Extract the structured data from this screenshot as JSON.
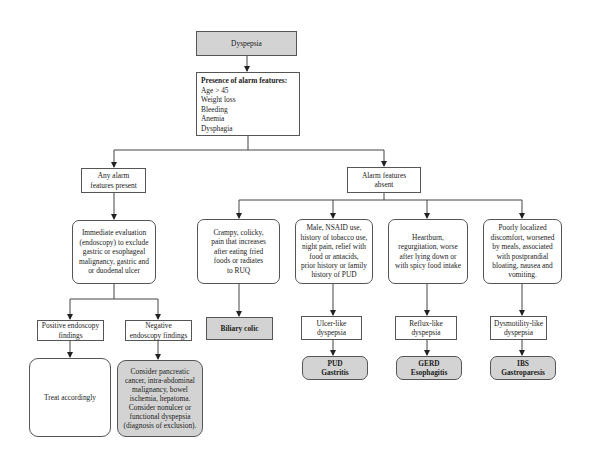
{
  "diagram": {
    "type": "flowchart",
    "nodes": {
      "root": {
        "label": "Dyspepsia",
        "fill": "#d3d3d3"
      },
      "alarm_check": {
        "title": "Presence of alarm features:",
        "items_text": "Age > 45\nWeight loss\nBleeding\nAnemia\nDysphagia",
        "items": [
          "Age > 45",
          "Weight loss",
          "Bleeding",
          "Anemia",
          "Dysphagia"
        ]
      },
      "alarm_present": {
        "label": "Any alarm\nfeatures present"
      },
      "alarm_absent": {
        "label": "Alarm features\nabsent"
      },
      "immediate_eval": {
        "label": "Immediate evaluation\n(endoscopy) to exclude\ngastric or esophageal\nmalignancy, gastric and\nor duodenal ulcer"
      },
      "positive_endo": {
        "label": "Positive endoscopy\nfindings"
      },
      "negative_endo": {
        "label": "Negative\nendoscopy findings"
      },
      "treat": {
        "label": "Treat accordingly"
      },
      "consider": {
        "label": "Consider pancreatic\ncancer, intra-abdominal\nmalignancy, bowel\nischemia, hepatoma.\nConsider nonulcer or\nfunctional dyspepsia\n(diagnosis of exclusion).",
        "fill": "#d3d3d3"
      },
      "crampy": {
        "label": "Crampy, colicky,\npain that increases\nafter eating fried\nfoods or radiates\nto RUQ"
      },
      "male_nsaid": {
        "label": "Male, NSAID use,\nhistory of tobacco use,\nnight pain, relief with\nfood or antacids,\nprior history or family\nhistory of PUD"
      },
      "heartburn": {
        "label": "Heartburn,\nregurgitation, worse\nafter lying down or\nwith spicy food intake"
      },
      "poorly_localized": {
        "label": "Poorly localized\ndiscomfort, worsened\nby meals, associated\nwith postprandial\nbloating, nausea and\nvomiting."
      },
      "biliary_colic": {
        "label": "Biliary colic",
        "fill": "#d3d3d3"
      },
      "ulcer_like": {
        "label": "Ulcer-like\ndyspepsia"
      },
      "reflux_like": {
        "label": "Reflux-like\ndyspepsia"
      },
      "dysmotility_like": {
        "label": "Dysmotility-like\ndyspepsia"
      },
      "pud": {
        "label": "PUD\nGastritis",
        "fill": "#d3d3d3"
      },
      "gerd": {
        "label": "GERD\nEsophagitis",
        "fill": "#d3d3d3"
      },
      "ibs": {
        "label": "IBS\nGastroparesis",
        "fill": "#d3d3d3"
      }
    },
    "edges": [
      [
        "root",
        "alarm_check"
      ],
      [
        "alarm_check",
        "alarm_present"
      ],
      [
        "alarm_check",
        "alarm_absent"
      ],
      [
        "alarm_present",
        "immediate_eval"
      ],
      [
        "immediate_eval",
        "positive_endo"
      ],
      [
        "immediate_eval",
        "negative_endo"
      ],
      [
        "positive_endo",
        "treat"
      ],
      [
        "negative_endo",
        "consider"
      ],
      [
        "alarm_absent",
        "crampy"
      ],
      [
        "alarm_absent",
        "male_nsaid"
      ],
      [
        "alarm_absent",
        "heartburn"
      ],
      [
        "alarm_absent",
        "poorly_localized"
      ],
      [
        "crampy",
        "biliary_colic"
      ],
      [
        "male_nsaid",
        "ulcer_like"
      ],
      [
        "heartburn",
        "reflux_like"
      ],
      [
        "poorly_localized",
        "dysmotility_like"
      ],
      [
        "ulcer_like",
        "pud"
      ],
      [
        "reflux_like",
        "gerd"
      ],
      [
        "dysmotility_like",
        "ibs"
      ]
    ],
    "colors": {
      "gray_fill": "#d3d3d3",
      "line": "#444444",
      "border": "#555555"
    }
  }
}
